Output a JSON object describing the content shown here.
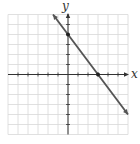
{
  "chart_data": {
    "type": "line",
    "title": "",
    "xlabel": "x",
    "ylabel": "y",
    "xlim": [
      -6,
      6
    ],
    "ylim": [
      -6,
      6
    ],
    "grid": true,
    "series": [
      {
        "name": "line",
        "equation": "y = -4/3 x + 4",
        "x": [
          -1.5,
          6
        ],
        "y": [
          6,
          -4
        ],
        "color": "#555555"
      }
    ],
    "points": [
      {
        "x": 0,
        "y": 4,
        "label": "y-intercept"
      },
      {
        "x": 3,
        "y": 0,
        "label": "x-intercept"
      }
    ]
  },
  "labels": {
    "x_axis": "x",
    "y_axis": "y"
  }
}
